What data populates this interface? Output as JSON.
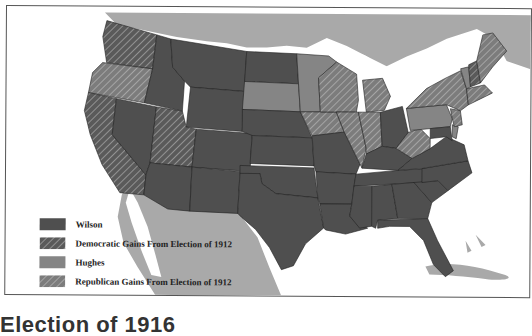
{
  "map": {
    "title": "Election of 1916",
    "colors": {
      "wilson": "#4f4f4f",
      "hughes": "#858585",
      "canada_mexico": "#a9a9a9",
      "water": "#ffffff",
      "border": "#222222"
    },
    "legend": [
      {
        "label": "Wilson",
        "pattern": "solid-dark"
      },
      {
        "label": "Democratic Gains From Election of 1912",
        "pattern": "hatched-dark"
      },
      {
        "label": "Hughes",
        "pattern": "solid-medium"
      },
      {
        "label": "Republican Gains From Election of 1912",
        "pattern": "hatched-medium"
      }
    ],
    "states": {
      "wilson": [
        "Montana",
        "Idaho",
        "Wyoming",
        "Colorado",
        "Nevada",
        "Arizona",
        "New Mexico",
        "Texas",
        "Oklahoma",
        "Kansas",
        "Nebraska",
        "North Dakota",
        "Missouri",
        "Arkansas",
        "Louisiana",
        "Mississippi",
        "Alabama",
        "Georgia",
        "Florida",
        "Tennessee",
        "Kentucky",
        "Ohio",
        "Virginia",
        "North Carolina",
        "South Carolina",
        "Maryland"
      ],
      "democratic_gains": [
        "Washington",
        "California",
        "Utah",
        "New Hampshire"
      ],
      "hughes": [
        "South Dakota",
        "Minnesota",
        "Pennsylvania",
        "Vermont",
        "Delaware"
      ],
      "republican_gains": [
        "Oregon",
        "Iowa",
        "Wisconsin",
        "Illinois",
        "Indiana",
        "Michigan",
        "New York",
        "New Jersey",
        "Connecticut",
        "Rhode Island",
        "Massachusetts",
        "Maine",
        "West Virginia"
      ]
    }
  }
}
